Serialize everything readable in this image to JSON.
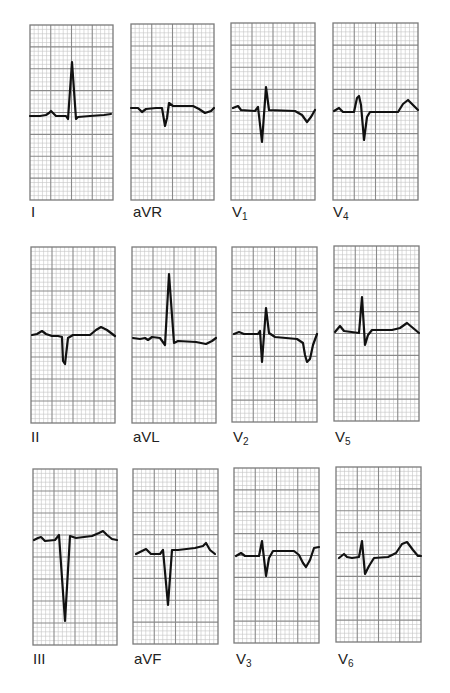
{
  "figure": {
    "grid": {
      "major_cols": 4,
      "major_rows": 8,
      "minor_per_major": 5,
      "major_color": "#8a8a8a",
      "minor_color": "#c4c4c4",
      "border_color": "#7a7a7a",
      "background": "#ffffff"
    },
    "trace_color": "#111111",
    "trace_width": 2.2,
    "label_color": "#222222"
  },
  "leads": [
    {
      "name": "I",
      "label_main": "I",
      "label_sub": "",
      "box": [
        30,
        25,
        83,
        175
      ],
      "label_pos": [
        31,
        204
      ],
      "trace": [
        [
          30,
          116
        ],
        [
          40,
          116
        ],
        [
          46,
          115
        ],
        [
          49,
          113
        ],
        [
          51,
          111
        ],
        [
          53,
          113
        ],
        [
          56,
          116
        ],
        [
          66,
          116
        ],
        [
          68,
          119
        ],
        [
          72,
          62
        ],
        [
          76,
          119
        ],
        [
          78,
          117
        ],
        [
          90,
          116
        ],
        [
          104,
          115
        ],
        [
          111,
          114
        ]
      ]
    },
    {
      "name": "aVR",
      "label_main": "aVR",
      "label_sub": "",
      "box": [
        131,
        24,
        83,
        176
      ],
      "label_pos": [
        133,
        204
      ],
      "trace": [
        [
          131,
          108
        ],
        [
          138,
          108
        ],
        [
          142,
          112
        ],
        [
          146,
          109
        ],
        [
          156,
          108
        ],
        [
          162,
          108
        ],
        [
          165,
          126
        ],
        [
          167,
          118
        ],
        [
          169,
          103
        ],
        [
          173,
          106
        ],
        [
          193,
          106
        ],
        [
          199,
          109
        ],
        [
          205,
          113
        ],
        [
          211,
          111
        ],
        [
          214,
          108
        ]
      ]
    },
    {
      "name": "V1",
      "label_main": "V",
      "label_sub": "1",
      "box": [
        231,
        23,
        84,
        177
      ],
      "label_pos": [
        232,
        204
      ],
      "trace": [
        [
          233,
          108
        ],
        [
          238,
          106
        ],
        [
          241,
          110
        ],
        [
          255,
          111
        ],
        [
          258,
          107
        ],
        [
          262,
          142
        ],
        [
          266,
          87
        ],
        [
          269,
          110
        ],
        [
          295,
          111
        ],
        [
          302,
          115
        ],
        [
          307,
          122
        ],
        [
          311,
          117
        ],
        [
          315,
          110
        ]
      ]
    },
    {
      "name": "V4",
      "label_main": "V",
      "label_sub": "4",
      "box": [
        333,
        23,
        85,
        177
      ],
      "label_pos": [
        333,
        204
      ],
      "trace": [
        [
          334,
          111
        ],
        [
          339,
          108
        ],
        [
          343,
          112
        ],
        [
          354,
          112
        ],
        [
          357,
          98
        ],
        [
          359,
          96
        ],
        [
          361,
          105
        ],
        [
          364,
          140
        ],
        [
          367,
          117
        ],
        [
          370,
          112
        ],
        [
          398,
          112
        ],
        [
          403,
          104
        ],
        [
          408,
          100
        ],
        [
          414,
          106
        ],
        [
          418,
          110
        ]
      ]
    },
    {
      "name": "II",
      "label_main": "II",
      "label_sub": "",
      "box": [
        31,
        247,
        84,
        176
      ],
      "label_pos": [
        31,
        429
      ],
      "trace": [
        [
          32,
          335
        ],
        [
          37,
          334
        ],
        [
          42,
          331
        ],
        [
          46,
          334
        ],
        [
          52,
          336
        ],
        [
          58,
          336
        ],
        [
          62,
          337
        ],
        [
          63,
          361
        ],
        [
          65,
          364
        ],
        [
          68,
          338
        ],
        [
          73,
          335
        ],
        [
          90,
          335
        ],
        [
          96,
          330
        ],
        [
          101,
          327
        ],
        [
          107,
          330
        ],
        [
          115,
          336
        ]
      ]
    },
    {
      "name": "aVL",
      "label_main": "aVL",
      "label_sub": "",
      "box": [
        132,
        247,
        84,
        176
      ],
      "label_pos": [
        133,
        429
      ],
      "trace": [
        [
          133,
          338
        ],
        [
          140,
          339
        ],
        [
          145,
          338
        ],
        [
          148,
          340
        ],
        [
          152,
          337
        ],
        [
          160,
          338
        ],
        [
          165,
          345
        ],
        [
          169,
          274
        ],
        [
          174,
          343
        ],
        [
          178,
          341
        ],
        [
          196,
          342
        ],
        [
          206,
          344
        ],
        [
          212,
          341
        ],
        [
          216,
          338
        ]
      ]
    },
    {
      "name": "V2",
      "label_main": "V",
      "label_sub": "2",
      "box": [
        232,
        247,
        85,
        175
      ],
      "label_pos": [
        233,
        429
      ],
      "trace": [
        [
          234,
          334
        ],
        [
          239,
          332
        ],
        [
          244,
          334
        ],
        [
          258,
          334
        ],
        [
          260,
          331
        ],
        [
          262,
          362
        ],
        [
          266,
          308
        ],
        [
          269,
          333
        ],
        [
          275,
          337
        ],
        [
          297,
          339
        ],
        [
          303,
          343
        ],
        [
          305,
          355
        ],
        [
          307,
          362
        ],
        [
          310,
          359
        ],
        [
          313,
          345
        ],
        [
          317,
          334
        ]
      ]
    },
    {
      "name": "V5",
      "label_main": "V",
      "label_sub": "5",
      "box": [
        334,
        246,
        85,
        175
      ],
      "label_pos": [
        335,
        429
      ],
      "trace": [
        [
          335,
          332
        ],
        [
          340,
          326
        ],
        [
          344,
          331
        ],
        [
          359,
          333
        ],
        [
          362,
          297
        ],
        [
          365,
          345
        ],
        [
          368,
          335
        ],
        [
          372,
          330
        ],
        [
          392,
          330
        ],
        [
          400,
          328
        ],
        [
          407,
          323
        ],
        [
          413,
          328
        ],
        [
          419,
          333
        ]
      ]
    },
    {
      "name": "III",
      "label_main": "III",
      "label_sub": "",
      "box": [
        33,
        469,
        84,
        176
      ],
      "label_pos": [
        33,
        651
      ],
      "trace": [
        [
          34,
          540
        ],
        [
          38,
          538
        ],
        [
          41,
          537
        ],
        [
          45,
          541
        ],
        [
          55,
          540
        ],
        [
          59,
          535
        ],
        [
          65,
          621
        ],
        [
          70,
          536
        ],
        [
          76,
          538
        ],
        [
          92,
          536
        ],
        [
          99,
          533
        ],
        [
          103,
          531
        ],
        [
          107,
          535
        ],
        [
          112,
          539
        ],
        [
          117,
          540
        ]
      ]
    },
    {
      "name": "aVF",
      "label_main": "aVF",
      "label_sub": "",
      "box": [
        133,
        469,
        85,
        175
      ],
      "label_pos": [
        134,
        651
      ],
      "trace": [
        [
          136,
          554
        ],
        [
          142,
          551
        ],
        [
          146,
          549
        ],
        [
          151,
          554
        ],
        [
          160,
          554
        ],
        [
          163,
          550
        ],
        [
          168,
          605
        ],
        [
          172,
          550
        ],
        [
          178,
          550
        ],
        [
          195,
          548
        ],
        [
          203,
          546
        ],
        [
          206,
          543
        ],
        [
          210,
          550
        ],
        [
          215,
          554
        ]
      ]
    },
    {
      "name": "V3",
      "label_main": "V",
      "label_sub": "3",
      "box": [
        234,
        468,
        85,
        175
      ],
      "label_pos": [
        236,
        651
      ],
      "trace": [
        [
          236,
          556
        ],
        [
          241,
          553
        ],
        [
          245,
          556
        ],
        [
          259,
          556
        ],
        [
          262,
          541
        ],
        [
          266,
          576
        ],
        [
          269,
          558
        ],
        [
          273,
          551
        ],
        [
          294,
          551
        ],
        [
          299,
          555
        ],
        [
          303,
          563
        ],
        [
          306,
          567
        ],
        [
          310,
          560
        ],
        [
          314,
          548
        ],
        [
          319,
          547
        ]
      ]
    },
    {
      "name": "V6",
      "label_main": "V",
      "label_sub": "6",
      "box": [
        336,
        467,
        85,
        175
      ],
      "label_pos": [
        338,
        651
      ],
      "trace": [
        [
          339,
          558
        ],
        [
          344,
          554
        ],
        [
          347,
          557
        ],
        [
          352,
          558
        ],
        [
          359,
          557
        ],
        [
          362,
          541
        ],
        [
          365,
          574
        ],
        [
          369,
          566
        ],
        [
          374,
          558
        ],
        [
          388,
          557
        ],
        [
          396,
          553
        ],
        [
          402,
          544
        ],
        [
          407,
          542
        ],
        [
          413,
          550
        ],
        [
          418,
          556
        ],
        [
          421,
          556
        ]
      ]
    }
  ]
}
